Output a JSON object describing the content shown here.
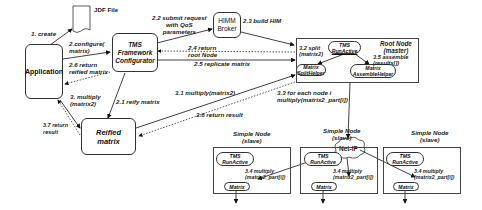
{
  "diagram": {
    "nodes": {
      "application": "Application",
      "jdf_file": "JDF File",
      "tms_configurator": [
        "TMS",
        "Framework",
        "Configurator"
      ],
      "himm_broker": [
        "HIMM",
        "Broker"
      ],
      "reified_matrix": [
        "Reified",
        "matrix"
      ],
      "root_node": [
        "Root Node",
        "(master)"
      ],
      "root_tms": [
        "TMS",
        "RunActive"
      ],
      "matrix_split_helper": [
        "Matrix",
        "SplitHelper"
      ],
      "matrix_assemble_helper": [
        "Matrix",
        "AssembleHelper"
      ],
      "net_ip": "Net-IP",
      "simple_nodes": [
        {
          "title": [
            "Simple Node",
            "(slave)"
          ],
          "tms": [
            "TMS",
            "RunActive"
          ],
          "step": [
            "3.4 multiply",
            "(matrix2_part[i])"
          ],
          "matrix": "Matrix"
        },
        {
          "title": [
            "Simple Node",
            "(slave)"
          ],
          "tms": [
            "TMS",
            "RunActive"
          ],
          "step": [
            "3.4 multiply",
            "(matrix2_part[i])"
          ],
          "matrix": "Matrix"
        },
        {
          "title": [
            "Simple Node",
            "(slave)"
          ],
          "tms": [
            "TMS",
            "RunActive"
          ],
          "step": [
            "3.4 multiply",
            "(matrix2_part[i])"
          ],
          "matrix": "Matrix"
        }
      ]
    },
    "edges": {
      "e1": "1. create",
      "e2": [
        "2.configure(",
        "matrix)"
      ],
      "e26": [
        "2.6 return",
        "reified matrix"
      ],
      "e22": [
        "2.2 submit request",
        "with QoS",
        "parameters"
      ],
      "e23": "2.3 build HIM",
      "e24": [
        "2.4 return",
        "root Node"
      ],
      "e25": "2.5 replicate matrix",
      "e21": "2.1 reify matrix",
      "e3": [
        "3. multiply",
        "(matrix2)"
      ],
      "e37": [
        "3.7 return",
        "result"
      ],
      "e31": "3.1 multiply(matrix2)",
      "e36": "3.6 return result",
      "e32": [
        "3.2 split",
        "(matrix2)"
      ],
      "e35": [
        "3.5 assemble",
        "(results[])"
      ],
      "e33": [
        "3.3 for each node i",
        "multiply(matrix2_part[i])"
      ]
    }
  }
}
